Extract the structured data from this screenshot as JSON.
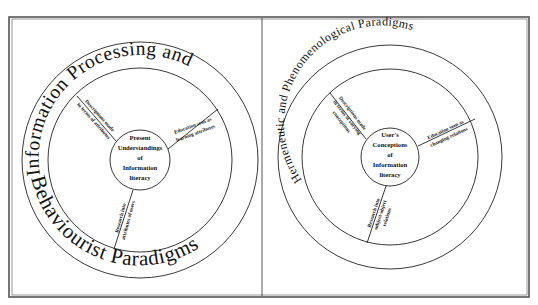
{
  "figure": {
    "left_panel": {
      "outer_title_top": "Information Processing and",
      "outer_title_bottom": "Behaviourist Paradigms",
      "center_lines": [
        "Present",
        "Understandings",
        "of",
        "Information",
        "literacy"
      ],
      "spokes": [
        {
          "line1": "Descriptions made",
          "line2": "in terms of attributes"
        },
        {
          "line1": "Education seen as",
          "line2": "learning attributes"
        },
        {
          "line1": "Research into",
          "line2": "attributes of users"
        }
      ]
    },
    "right_panel": {
      "outer_title": "Hermeneutic and Phenomenological Paradigms",
      "center_lines": [
        "User's",
        "Conceptions",
        "of",
        "Information",
        "literacy"
      ],
      "spokes": [
        {
          "line1": "Descriptions made",
          "line2": "in terms of varying",
          "line3": "conceptions"
        },
        {
          "line1": "Education seen as",
          "line2": "changing relations"
        },
        {
          "line1": "Research into",
          "line2": "subject-object",
          "line3": "relations"
        }
      ]
    },
    "colors": {
      "line": "#222222",
      "frame": "#555555",
      "background": "#ffffff"
    }
  }
}
